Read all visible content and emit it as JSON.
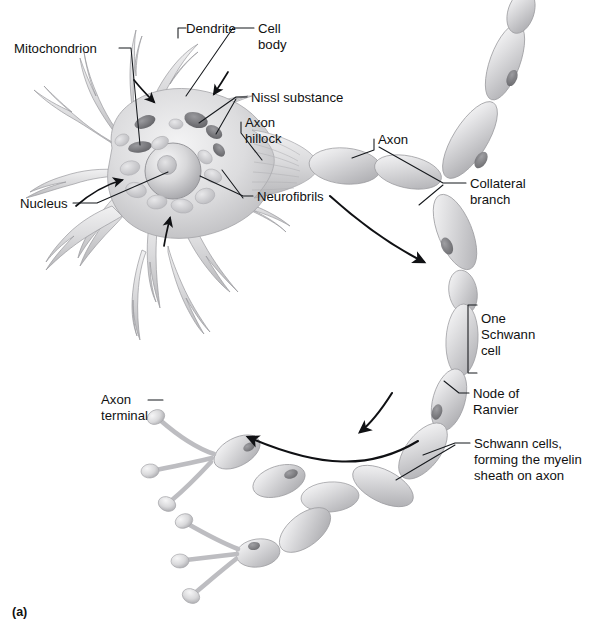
{
  "figure": {
    "panel_label": "(a)"
  },
  "labels": {
    "mitochondrion": "Mitochondrion",
    "dendrite": "Dendrite",
    "cell_body_line1": "Cell",
    "cell_body_line2": "body",
    "nissl_substance": "Nissl substance",
    "axon_hillock_line1": "Axon",
    "axon_hillock_line2": "hillock",
    "axon": "Axon",
    "collateral_line1": "Collateral",
    "collateral_line2": "branch",
    "nucleus": "Nucleus",
    "neurofibrils": "Neurofibrils",
    "one_schwann_line1": "One",
    "one_schwann_line2": "Schwann",
    "one_schwann_line3": "cell",
    "node_line1": "Node of",
    "node_line2": "Ranvier",
    "schwann_cells_line1": "Schwann cells,",
    "schwann_cells_line2": "forming the myelin",
    "schwann_cells_line3": "sheath on axon",
    "axon_terminal_line1": "Axon",
    "axon_terminal_line2": "terminal"
  },
  "colors": {
    "ink": "#101114",
    "page": "#ffffff",
    "cell_light": "#e9e9ea",
    "cell_mid": "#c9c9cb",
    "cell_dark": "#8d8d90",
    "organelle_dark": "#6f7073",
    "myelin_light": "#f2f2f3",
    "myelin_mid": "#cfcfd1"
  }
}
